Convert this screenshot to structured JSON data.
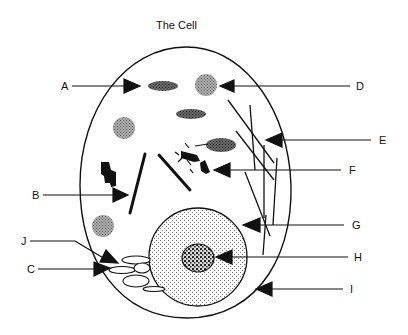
{
  "diagram": {
    "title": "The Cell",
    "labels": [
      {
        "id": "A",
        "text": "A"
      },
      {
        "id": "B",
        "text": "B"
      },
      {
        "id": "C",
        "text": "C"
      },
      {
        "id": "D",
        "text": "D"
      },
      {
        "id": "E",
        "text": "E"
      },
      {
        "id": "F",
        "text": "F"
      },
      {
        "id": "G",
        "text": "G"
      },
      {
        "id": "H",
        "text": "H"
      },
      {
        "id": "I",
        "text": "I"
      },
      {
        "id": "J",
        "text": "J"
      }
    ],
    "colors": {
      "ink": "#111111",
      "background": "#ffffff",
      "dark_stipple": "#555555",
      "light_stipple": "#9a9a9a",
      "nucleus_fill": "#e6e6e6"
    }
  }
}
